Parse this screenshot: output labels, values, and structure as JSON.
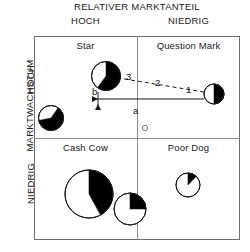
{
  "diagram": {
    "type": "bcg-matrix",
    "top_axis_title": "RELATIVER MARKTANTEIL",
    "left_axis_title": "MARKTWACHSTUM",
    "column_headers": [
      "HOCH",
      "NIEDRIG"
    ],
    "row_headers": [
      "HOCH",
      "NIEDRIG"
    ],
    "quadrants": [
      {
        "key": "star",
        "label": "Star",
        "column": "HOCH",
        "row": "HOCH"
      },
      {
        "key": "question",
        "label": "Question Mark",
        "column": "NIEDRIG",
        "row": "HOCH"
      },
      {
        "key": "cashcow",
        "label": "Cash Cow",
        "column": "HOCH",
        "row": "NIEDRIG"
      },
      {
        "key": "poordog",
        "label": "Poor Dog",
        "column": "NIEDRIG",
        "row": "NIEDRIG"
      }
    ],
    "bubbles": [
      {
        "name": "star-large-bubble",
        "quadrant": "star",
        "cx": 106,
        "cy": 76,
        "r": 14.5,
        "black_share": 0.6,
        "start_angle_deg": 0
      },
      {
        "name": "star-small-bubble",
        "quadrant": "star",
        "cx": 51,
        "cy": 118,
        "r": 12.5,
        "black_share": 0.62,
        "start_angle_deg": 35
      },
      {
        "name": "question-bubble",
        "quadrant": "question",
        "cx": 214,
        "cy": 94,
        "r": 10.0,
        "black_share": 0.5,
        "start_angle_deg": 0
      },
      {
        "name": "cashcow-large-bubble",
        "quadrant": "cashcow",
        "cx": 89,
        "cy": 194,
        "r": 24.0,
        "black_share": 0.42,
        "start_angle_deg": 0
      },
      {
        "name": "cashcow-small-bubble",
        "quadrant": "cashcow",
        "cx": 130,
        "cy": 209,
        "r": 16.0,
        "black_share": 0.25,
        "start_angle_deg": 0
      },
      {
        "name": "poordog-bubble",
        "quadrant": "poordog",
        "cx": 188,
        "cy": 185,
        "r": 12.0,
        "black_share": 0.12,
        "start_angle_deg": 0
      }
    ],
    "marker": {
      "name": "reference-circle-marker",
      "cx": 145,
      "cy": 128,
      "r": 2.6
    },
    "trajectory": {
      "name": "movement-path",
      "style": "dashed",
      "points": [
        [
          204,
          92
        ],
        [
          106,
          76
        ]
      ],
      "segment_labels": [
        {
          "text": "1",
          "x": 186,
          "y": 84
        },
        {
          "text": "2",
          "x": 155,
          "y": 77
        },
        {
          "text": "3",
          "x": 126,
          "y": 71
        }
      ]
    },
    "components": [
      {
        "letter": "a",
        "name": "horizontal-component-arrow",
        "label_x": 133,
        "label_y": 105,
        "line": {
          "x1": 204,
          "y1": 99,
          "x2": 92,
          "y2": 99
        },
        "direction": "left"
      },
      {
        "letter": "b",
        "name": "vertical-component-arrow",
        "label_x": 92,
        "label_y": 86,
        "line": {
          "x1": 98,
          "y1": 92,
          "x2": 98,
          "y2": 110
        },
        "direction": "down"
      }
    ],
    "colors": {
      "frame": "#6f6f6f",
      "divider": "#8a8a8a",
      "pie_fill": "#000000",
      "pie_stroke": "#1a1a1a",
      "text": "#1a1a1a",
      "background": "#ffffff"
    }
  }
}
